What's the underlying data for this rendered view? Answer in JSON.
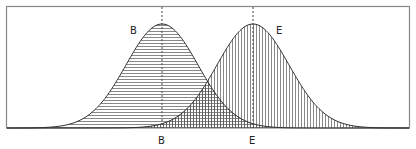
{
  "diagram": {
    "type": "overlapping-normal-distributions",
    "curves": [
      {
        "name": "B",
        "label": "B",
        "mean_x": 162,
        "fill_pattern": "horizontal-hatch"
      },
      {
        "name": "E",
        "label": "E",
        "mean_x": 253,
        "fill_pattern": "vertical-hatch"
      }
    ],
    "axis_labels": [
      "B",
      "E"
    ],
    "overlap_pattern": "crosshatch"
  },
  "labels": {
    "curve_b": "B",
    "curve_e": "E",
    "axis_b": "B",
    "axis_e": "E"
  },
  "colors": {
    "line": "#333333",
    "hatch": "#555555",
    "frame": "#888888"
  }
}
